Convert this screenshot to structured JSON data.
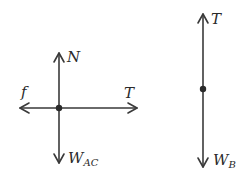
{
  "diagrams": [
    {
      "name": "free-body-AC",
      "labels": {
        "up": "N",
        "left": "f",
        "right": "T",
        "down_main": "W",
        "down_sub": "AC"
      }
    },
    {
      "name": "free-body-B",
      "labels": {
        "up": "T",
        "down_main": "W",
        "down_sub": "B"
      }
    }
  ],
  "colors": {
    "line": "#3a3a3a",
    "background": "#ffffff"
  }
}
